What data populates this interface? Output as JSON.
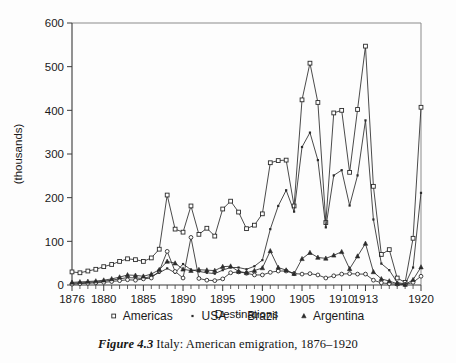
{
  "caption": {
    "figure_number": "Figure 4.3",
    "text": "Italy: American emigration, 1876–1920"
  },
  "chart_data": {
    "type": "line",
    "title": "",
    "subtitle": "",
    "xlabel": "Destinations",
    "ylabel": "(thousands)",
    "xlim": [
      1876,
      1920
    ],
    "ylim": [
      0,
      600
    ],
    "ytick_labels": [
      "0",
      "100",
      "200",
      "300",
      "400",
      "500",
      "600"
    ],
    "yticks": [
      0,
      100,
      200,
      300,
      400,
      500,
      600
    ],
    "xtick_labels": [
      "1876",
      "1880",
      "1885",
      "1890",
      "1895",
      "1900",
      "1905",
      "1910",
      "1913",
      "1920"
    ],
    "xticks": [
      1876,
      1880,
      1885,
      1890,
      1895,
      1900,
      1905,
      1910,
      1913,
      1920
    ],
    "grid": false,
    "legend_position": "below-axis",
    "x": [
      1876,
      1877,
      1878,
      1879,
      1880,
      1881,
      1882,
      1883,
      1884,
      1885,
      1886,
      1887,
      1888,
      1889,
      1890,
      1891,
      1892,
      1893,
      1894,
      1895,
      1896,
      1897,
      1898,
      1899,
      1900,
      1901,
      1902,
      1903,
      1904,
      1905,
      1906,
      1907,
      1908,
      1909,
      1910,
      1911,
      1912,
      1913,
      1914,
      1915,
      1916,
      1917,
      1918,
      1919,
      1920
    ],
    "series": [
      {
        "name": "Americas",
        "marker": "square",
        "values": [
          30,
          28,
          32,
          36,
          42,
          47,
          54,
          60,
          58,
          54,
          62,
          82,
          206,
          128,
          121,
          181,
          116,
          130,
          112,
          174,
          192,
          167,
          129,
          137,
          163,
          280,
          285,
          286,
          181,
          424,
          508,
          418,
          143,
          394,
          400,
          258,
          402,
          547,
          226,
          70,
          81,
          16,
          6,
          107,
          407
        ]
      },
      {
        "name": "USA",
        "marker": "dot",
        "values": [
          4,
          5,
          6,
          7,
          9,
          11,
          14,
          17,
          16,
          15,
          20,
          28,
          38,
          28,
          48,
          35,
          31,
          28,
          26,
          34,
          40,
          40,
          36,
          43,
          57,
          128,
          181,
          217,
          168,
          316,
          349,
          286,
          132,
          251,
          263,
          182,
          251,
          377,
          150,
          49,
          34,
          6,
          2,
          40,
          211
        ]
      },
      {
        "name": "Brazil",
        "marker": "circle",
        "values": [
          2,
          3,
          4,
          5,
          6,
          8,
          10,
          12,
          11,
          14,
          16,
          32,
          77,
          31,
          16,
          109,
          15,
          11,
          10,
          14,
          28,
          30,
          27,
          23,
          23,
          29,
          32,
          32,
          26,
          25,
          26,
          23,
          16,
          21,
          25,
          26,
          25,
          25,
          11,
          5,
          3,
          2,
          1,
          6,
          20
        ]
      },
      {
        "name": "Argentina",
        "marker": "triangle",
        "values": [
          6,
          7,
          8,
          9,
          11,
          14,
          18,
          23,
          22,
          20,
          25,
          35,
          54,
          50,
          36,
          33,
          35,
          34,
          33,
          42,
          43,
          31,
          28,
          33,
          39,
          78,
          40,
          34,
          26,
          60,
          74,
          63,
          61,
          68,
          76,
          37,
          66,
          95,
          30,
          14,
          9,
          3,
          1,
          12,
          41
        ]
      }
    ]
  },
  "legend": {
    "items": [
      {
        "label": "Americas",
        "marker": "square"
      },
      {
        "label": "USA",
        "marker": "dot"
      },
      {
        "label": "Brazil",
        "marker": "circle"
      },
      {
        "label": "Argentina",
        "marker": "triangle"
      }
    ]
  }
}
